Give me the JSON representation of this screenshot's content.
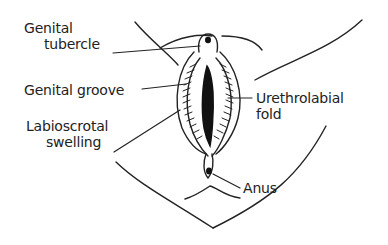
{
  "diagram": {
    "labels": {
      "genital_tubercle": [
        "Genital",
        "tubercle"
      ],
      "genital_groove": "Genital groove",
      "labioscrotal_swelling": [
        "Labioscrotal",
        "swelling"
      ],
      "urethrolabial_fold": [
        "Urethrolabial",
        "fold"
      ],
      "anus": "Anus"
    },
    "colors": {
      "line": "#222222",
      "background": "#ffffff"
    }
  }
}
